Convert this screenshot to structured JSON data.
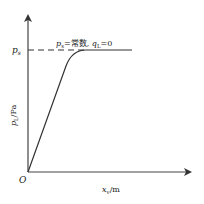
{
  "diagram": {
    "type": "line",
    "y_axis_label": "p",
    "y_axis_label_sub": "L",
    "y_axis_unit": "/Pa",
    "x_axis_label": "x",
    "x_axis_label_sub": "v",
    "x_axis_unit": "/m",
    "origin_label": "O",
    "ps_tick_label": "p",
    "ps_tick_label_sub": "s",
    "annotation": {
      "p": "p",
      "p_sub": "s",
      "eq": "=常数, ",
      "q": "q",
      "q_sub": "L",
      "tail": "=0"
    },
    "line_color": "#333333",
    "curve": {
      "description": "linear rise from origin to saturation at p_s, then constant",
      "plateau_level": "p_s"
    }
  }
}
